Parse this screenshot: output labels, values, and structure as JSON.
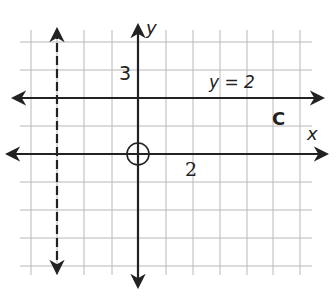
{
  "diagram": {
    "type": "coordinate-grid",
    "grid": {
      "x_lines": [
        31,
        57,
        84,
        112,
        138,
        166,
        193,
        220,
        247,
        273,
        300
      ],
      "y_lines": [
        42,
        70,
        98,
        126,
        154,
        182,
        210,
        238,
        266
      ],
      "left": 20,
      "right": 312,
      "top": 30,
      "bottom": 275,
      "color": "#b8b8b8"
    },
    "axes": {
      "x_label": "x",
      "y_label": "y",
      "origin_px": [
        138,
        154
      ],
      "color": "#222222"
    },
    "labels": {
      "y_axis_mark": "3",
      "x_axis_mark": "2",
      "line_equation": "y = 2",
      "line_name": "C"
    },
    "lines": [
      {
        "name": "horizontal-line-y2",
        "label": "y = 2",
        "y_px": 98,
        "style": "solid"
      },
      {
        "name": "dashed-vertical-line",
        "x_px": 57,
        "style": "dashed"
      }
    ],
    "point": {
      "name": "open-circle-at-origin",
      "cx": 138,
      "cy": 154,
      "r": 11
    }
  }
}
